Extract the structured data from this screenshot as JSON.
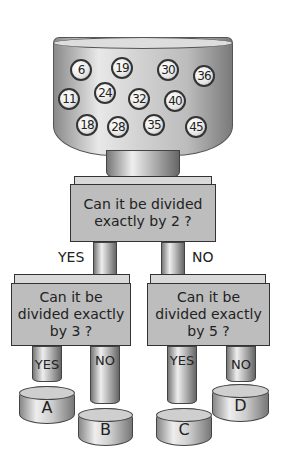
{
  "container": {
    "balls": [
      "6",
      "19",
      "30",
      "36",
      "11",
      "24",
      "32",
      "40",
      "18",
      "28",
      "35",
      "45"
    ]
  },
  "decision_root": {
    "question": "Can it be divided exactly by 2 ?",
    "yes_label": "YES",
    "no_label": "NO"
  },
  "decision_left": {
    "question": "Can it be divided exactly by 3 ?",
    "yes_label": "YES",
    "no_label": "NO"
  },
  "decision_right": {
    "question": "Can it be divided exactly by 5 ?",
    "yes_label": "YES",
    "no_label": "NO"
  },
  "bins": [
    "A",
    "B",
    "C",
    "D"
  ]
}
